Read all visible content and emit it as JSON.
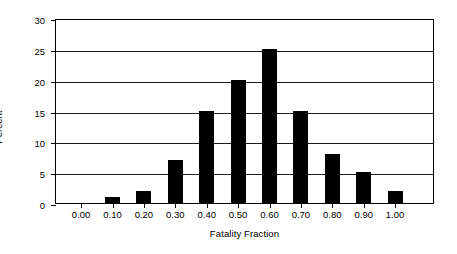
{
  "chart_data": {
    "type": "bar",
    "title": "",
    "subtitle": "",
    "xlabel": "Fatality Fraction",
    "ylabel": "Percent",
    "categories": [
      "0.00",
      "0.10",
      "0.20",
      "0.30",
      "0.40",
      "0.50",
      "0.60",
      "0.70",
      "0.80",
      "0.90",
      "1.00"
    ],
    "values": [
      0,
      1,
      2,
      7,
      15,
      20,
      25,
      15,
      8,
      5,
      2
    ],
    "xlim": [
      0.0,
      1.0
    ],
    "ylim": [
      0,
      30
    ],
    "ytick_labels": [
      "0",
      "5",
      "10",
      "15",
      "20",
      "25",
      "30"
    ],
    "ytick_values": [
      0,
      5,
      10,
      15,
      20,
      25,
      30
    ],
    "xtick_labels": [
      "0.00",
      "0.10",
      "0.20",
      "0.30",
      "0.40",
      "0.50",
      "0.60",
      "0.70",
      "0.80",
      "0.90",
      "1.00"
    ],
    "grid": "horizontal",
    "legend": null,
    "bar_color": "#000000",
    "axis_color": "#000000",
    "grid_color": "#1a1a1a",
    "background_color": "#ffffff"
  }
}
